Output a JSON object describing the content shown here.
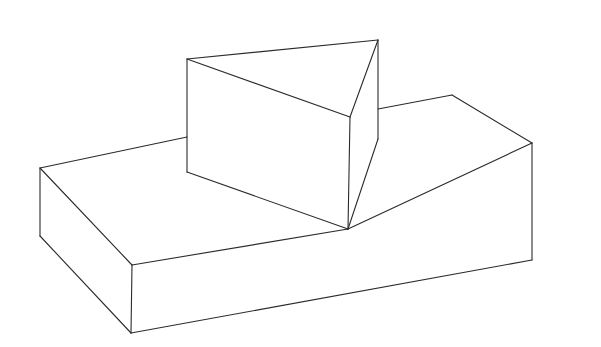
{
  "figure": {
    "canvas": {
      "width": 601,
      "height": 347,
      "background": "#ffffff"
    },
    "stroke_color": "#2b2b2b",
    "objects": [
      {
        "name": "slab",
        "edges": [
          [
            [
              40,
              168
            ],
            [
              187,
              137
            ]
          ],
          [
            [
              378,
              109
            ],
            [
              452,
              95
            ]
          ],
          [
            [
              452,
              95
            ],
            [
              532,
              143
            ]
          ],
          [
            [
              40,
              168
            ],
            [
              132,
              265
            ]
          ],
          [
            [
              132,
              265
            ],
            [
              348,
              229
            ]
          ],
          [
            [
              348,
              229
            ],
            [
              532,
              143
            ]
          ],
          [
            [
              40,
              168
            ],
            [
              40,
              236
            ]
          ],
          [
            [
              40,
              236
            ],
            [
              131,
              333
            ]
          ],
          [
            [
              132,
              265
            ],
            [
              131,
              333
            ]
          ],
          [
            [
              131,
              333
            ],
            [
              532,
              260
            ]
          ],
          [
            [
              532,
              143
            ],
            [
              532,
              260
            ]
          ]
        ]
      },
      {
        "name": "triangular-prism",
        "edges": [
          [
            [
              187,
              59
            ],
            [
              378,
              40
            ]
          ],
          [
            [
              187,
              59
            ],
            [
              350,
              117
            ]
          ],
          [
            [
              350,
              117
            ],
            [
              378,
              40
            ]
          ],
          [
            [
              187,
              59
            ],
            [
              187,
              172
            ]
          ],
          [
            [
              350,
              117
            ],
            [
              348,
              229
            ]
          ],
          [
            [
              378,
              40
            ],
            [
              378,
              139
            ]
          ],
          [
            [
              187,
              172
            ],
            [
              348,
              229
            ]
          ],
          [
            [
              348,
              229
            ],
            [
              378,
              139
            ]
          ]
        ]
      }
    ]
  }
}
